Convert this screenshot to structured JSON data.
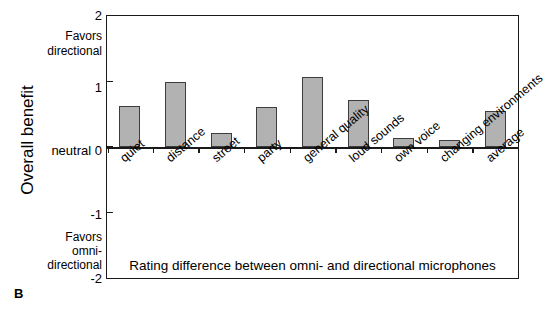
{
  "panel": {
    "letter": "B"
  },
  "chart_data": {
    "type": "bar",
    "title": "",
    "subtitle": "",
    "xlabel": "Rating difference between omni- and directional microphones",
    "ylabel": "Overall benefit",
    "ylim": [
      -2,
      2
    ],
    "yticks": [
      2,
      1,
      0,
      -1,
      -2
    ],
    "ytick_labels": [
      "2",
      "1",
      "0",
      "-1",
      "-2"
    ],
    "zero_tick_prefix": "neutral",
    "axis_annotation_top": [
      "Favors",
      "directional"
    ],
    "axis_annotation_bottom": [
      "Favors",
      "omni-",
      "directional"
    ],
    "grid": false,
    "legend": null,
    "bar_color": "#b2b2b2",
    "bar_edge_color": "#3d3d3d",
    "axis_color": "#1a1a1a",
    "categories": [
      "quiet",
      "distance",
      "street",
      "party",
      "general quality",
      "loud sounds",
      "own voice",
      "changing environments",
      "average"
    ],
    "values": [
      0.62,
      1.0,
      0.21,
      0.61,
      1.07,
      0.72,
      0.14,
      0.1,
      0.55
    ]
  }
}
